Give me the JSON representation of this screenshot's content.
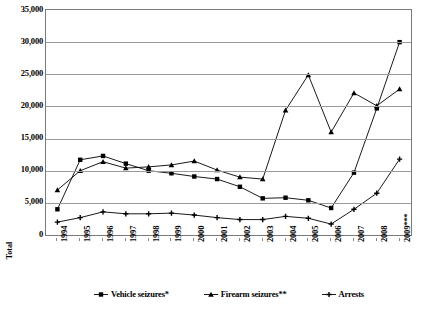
{
  "chart_data": {
    "type": "line",
    "title": "",
    "xlabel": "",
    "ylabel": "Total",
    "ylim": [
      0,
      35000
    ],
    "ytick_step": 5000,
    "grid": true,
    "legend_position": "bottom",
    "categories": [
      "1994",
      "1995",
      "1996",
      "1997",
      "1998",
      "1999",
      "2000",
      "2001",
      "2002",
      "2003",
      "2004",
      "2005",
      "2006",
      "2007",
      "2008",
      "2009***"
    ],
    "yticks": [
      "0",
      "5,000",
      "10,000",
      "15,000",
      "20,000",
      "25,000",
      "30,000",
      "35,000"
    ],
    "ytick_values": [
      0,
      5000,
      10000,
      15000,
      20000,
      25000,
      30000,
      35000
    ],
    "series": [
      {
        "name": "Vehicle seizures*",
        "marker": "square",
        "color": "#000000",
        "values": [
          4000,
          11700,
          12300,
          11100,
          10000,
          9600,
          9100,
          8700,
          7500,
          5700,
          5800,
          5400,
          4200,
          9700,
          19700,
          30000
        ]
      },
      {
        "name": "Firearm seizures**",
        "marker": "triangle",
        "color": "#000000",
        "values": [
          7000,
          10000,
          11400,
          10400,
          10600,
          10900,
          11500,
          10100,
          9000,
          8700,
          19400,
          24900,
          16000,
          22100,
          20100,
          22700
        ]
      },
      {
        "name": "Arrests",
        "marker": "plus",
        "color": "#000000",
        "values": [
          2000,
          2700,
          3600,
          3300,
          3300,
          3400,
          3100,
          2700,
          2400,
          2400,
          2900,
          2600,
          1700,
          4000,
          6500,
          11800
        ]
      }
    ]
  }
}
